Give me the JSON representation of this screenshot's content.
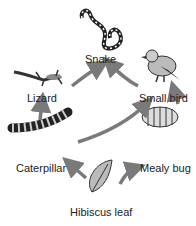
{
  "nodes": {
    "snake": {
      "label": "Snake"
    },
    "lizard": {
      "label": "Lizard"
    },
    "small_bird": {
      "label": "Small bird"
    },
    "caterpillar": {
      "label": "Caterpillar"
    },
    "mealy_bug": {
      "label": "Mealy bug"
    },
    "hibiscus_leaf": {
      "label": "Hibiscus leaf"
    }
  },
  "edges": [
    {
      "from": "Hibiscus leaf",
      "to": "Caterpillar"
    },
    {
      "from": "Hibiscus leaf",
      "to": "Mealy bug"
    },
    {
      "from": "Caterpillar",
      "to": "Lizard"
    },
    {
      "from": "Caterpillar",
      "to": "Small bird"
    },
    {
      "from": "Mealy bug",
      "to": "Small bird"
    },
    {
      "from": "Lizard",
      "to": "Snake"
    },
    {
      "from": "Small bird",
      "to": "Snake"
    }
  ],
  "colors": {
    "arrow": "#7a7a7a",
    "organism": "#333333"
  }
}
